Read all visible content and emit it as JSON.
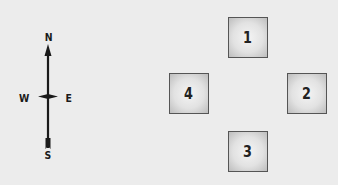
{
  "compass": {
    "north": "N",
    "south": "S",
    "west": "W",
    "east": "E"
  },
  "boxes": [
    {
      "label": "1",
      "position": "top"
    },
    {
      "label": "2",
      "position": "right"
    },
    {
      "label": "3",
      "position": "bottom"
    },
    {
      "label": "4",
      "position": "left"
    }
  ],
  "colors": {
    "background": "#ececec",
    "ink": "#1a1a1a",
    "box_border": "#555555"
  }
}
